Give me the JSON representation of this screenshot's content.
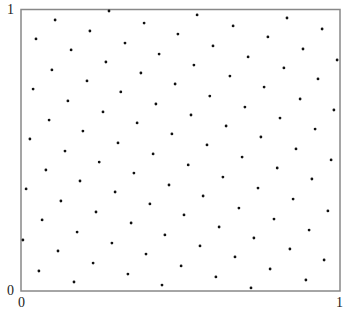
{
  "chart_data": {
    "type": "scatter",
    "title": "",
    "xlabel": "",
    "ylabel": "",
    "xlim": [
      0,
      1
    ],
    "ylim": [
      0,
      1
    ],
    "grid": false,
    "legend": null,
    "x_ticks": [
      "0",
      "1"
    ],
    "y_ticks": [
      "0",
      "1"
    ],
    "marker_color": "#111111",
    "axes_color": "#888888",
    "points": [
      [
        0.276,
        0.993
      ],
      [
        0.552,
        0.979
      ],
      [
        0.834,
        0.968
      ],
      [
        0.107,
        0.961
      ],
      [
        0.386,
        0.95
      ],
      [
        0.665,
        0.94
      ],
      [
        0.944,
        0.929
      ],
      [
        0.216,
        0.922
      ],
      [
        0.492,
        0.911
      ],
      [
        0.774,
        0.901
      ],
      [
        0.047,
        0.894
      ],
      [
        0.326,
        0.879
      ],
      [
        0.602,
        0.869
      ],
      [
        0.884,
        0.858
      ],
      [
        0.157,
        0.855
      ],
      [
        0.433,
        0.84
      ],
      [
        0.712,
        0.83
      ],
      [
        0.991,
        0.819
      ],
      [
        0.266,
        0.812
      ],
      [
        0.542,
        0.801
      ],
      [
        0.824,
        0.791
      ],
      [
        0.097,
        0.784
      ],
      [
        0.376,
        0.773
      ],
      [
        0.655,
        0.762
      ],
      [
        0.931,
        0.752
      ],
      [
        0.207,
        0.745
      ],
      [
        0.483,
        0.734
      ],
      [
        0.762,
        0.723
      ],
      [
        0.038,
        0.716
      ],
      [
        0.313,
        0.706
      ],
      [
        0.592,
        0.691
      ],
      [
        0.875,
        0.681
      ],
      [
        0.147,
        0.674
      ],
      [
        0.423,
        0.663
      ],
      [
        0.702,
        0.652
      ],
      [
        0.981,
        0.642
      ],
      [
        0.257,
        0.635
      ],
      [
        0.533,
        0.624
      ],
      [
        0.812,
        0.613
      ],
      [
        0.088,
        0.606
      ],
      [
        0.364,
        0.596
      ],
      [
        0.643,
        0.585
      ],
      [
        0.922,
        0.574
      ],
      [
        0.194,
        0.567
      ],
      [
        0.473,
        0.557
      ],
      [
        0.752,
        0.546
      ],
      [
        0.028,
        0.539
      ],
      [
        0.304,
        0.525
      ],
      [
        0.583,
        0.518
      ],
      [
        0.862,
        0.504
      ],
      [
        0.138,
        0.496
      ],
      [
        0.414,
        0.486
      ],
      [
        0.693,
        0.475
      ],
      [
        0.972,
        0.465
      ],
      [
        0.245,
        0.457
      ],
      [
        0.524,
        0.447
      ],
      [
        0.803,
        0.436
      ],
      [
        0.078,
        0.429
      ],
      [
        0.354,
        0.418
      ],
      [
        0.633,
        0.404
      ],
      [
        0.912,
        0.397
      ],
      [
        0.185,
        0.39
      ],
      [
        0.464,
        0.376
      ],
      [
        0.743,
        0.365
      ],
      [
        0.016,
        0.362
      ],
      [
        0.295,
        0.351
      ],
      [
        0.571,
        0.337
      ],
      [
        0.853,
        0.326
      ],
      [
        0.125,
        0.319
      ],
      [
        0.404,
        0.309
      ],
      [
        0.683,
        0.294
      ],
      [
        0.962,
        0.284
      ],
      [
        0.235,
        0.28
      ],
      [
        0.511,
        0.27
      ],
      [
        0.793,
        0.255
      ],
      [
        0.066,
        0.252
      ],
      [
        0.345,
        0.241
      ],
      [
        0.621,
        0.227
      ],
      [
        0.903,
        0.216
      ],
      [
        0.176,
        0.209
      ],
      [
        0.451,
        0.199
      ],
      [
        0.73,
        0.188
      ],
      [
        0.006,
        0.181
      ],
      [
        0.285,
        0.17
      ],
      [
        0.561,
        0.16
      ],
      [
        0.843,
        0.149
      ],
      [
        0.116,
        0.142
      ],
      [
        0.392,
        0.131
      ],
      [
        0.671,
        0.121
      ],
      [
        0.95,
        0.11
      ],
      [
        0.226,
        0.099
      ],
      [
        0.502,
        0.089
      ],
      [
        0.781,
        0.078
      ],
      [
        0.056,
        0.071
      ],
      [
        0.335,
        0.06
      ],
      [
        0.611,
        0.05
      ],
      [
        0.893,
        0.039
      ],
      [
        0.166,
        0.032
      ],
      [
        0.442,
        0.021
      ],
      [
        0.721,
        0.011
      ]
    ]
  },
  "axes": {
    "y_top_label": "1",
    "y_bottom_label": "0",
    "x_left_label": "0",
    "x_right_label": "1"
  }
}
